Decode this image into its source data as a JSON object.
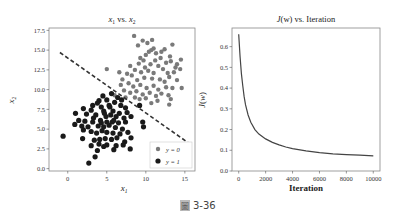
{
  "chart_data": [
    {
      "type": "scatter",
      "title": "x1 vs. x2",
      "title_parts": {
        "a": "x",
        "a_sub": "1",
        "mid": " vs. ",
        "b": "x",
        "b_sub": "2"
      },
      "xlabel": "x1",
      "ylabel": "x2",
      "xlim": [
        -2.4,
        16.3
      ],
      "ylim": [
        -0.3,
        17.8
      ],
      "xticks": [
        0,
        5,
        10,
        15
      ],
      "xtick_labels": [
        "0",
        "5",
        "10",
        "15"
      ],
      "yticks": [
        0.0,
        2.5,
        5.0,
        7.5,
        10.0,
        12.5,
        15.0,
        17.5
      ],
      "ytick_labels": [
        "0.0",
        "2.5",
        "5.0",
        "7.5",
        "10.0",
        "12.5",
        "15.0",
        "17.5"
      ],
      "grid": false,
      "legend": {
        "placement": "bottom-right",
        "entries": [
          {
            "label": "y = 0",
            "color": "#7a7a7a"
          },
          {
            "label": "y = 1",
            "color": "#1a1a1a"
          }
        ]
      },
      "decision_boundary": {
        "style": "dashed",
        "color": "#333333",
        "points": [
          [
            -1.0,
            14.7
          ],
          [
            15.4,
            3.3
          ]
        ]
      },
      "series": [
        {
          "name": "y = 0",
          "color": "#7a7a7a",
          "points": [
            [
              8.5,
              16.8
            ],
            [
              9.6,
              16.2
            ],
            [
              10.2,
              15.9
            ],
            [
              10.8,
              16.3
            ],
            [
              9.0,
              15.6
            ],
            [
              11.0,
              15.2
            ],
            [
              13.4,
              15.7
            ],
            [
              12.0,
              14.8
            ],
            [
              10.4,
              14.8
            ],
            [
              9.3,
              14.0
            ],
            [
              10.0,
              14.4
            ],
            [
              11.3,
              14.6
            ],
            [
              12.6,
              13.4
            ],
            [
              13.2,
              13.6
            ],
            [
              14.0,
              13.2
            ],
            [
              14.5,
              13.8
            ],
            [
              13.8,
              12.8
            ],
            [
              9.1,
              13.3
            ],
            [
              10.6,
              13.2
            ],
            [
              11.6,
              13.0
            ],
            [
              12.2,
              12.6
            ],
            [
              8.6,
              12.5
            ],
            [
              9.4,
              12.2
            ],
            [
              10.3,
              12.4
            ],
            [
              11.0,
              12.1
            ],
            [
              12.8,
              12.1
            ],
            [
              13.6,
              12.2
            ],
            [
              14.4,
              12.6
            ],
            [
              7.6,
              12.0
            ],
            [
              8.2,
              11.8
            ],
            [
              5.0,
              12.6
            ],
            [
              6.6,
              12.2
            ],
            [
              7.0,
              11.3
            ],
            [
              8.9,
              11.2
            ],
            [
              9.8,
              11.5
            ],
            [
              10.8,
              11.4
            ],
            [
              11.8,
              11.3
            ],
            [
              12.4,
              11.0
            ],
            [
              13.0,
              11.6
            ],
            [
              14.0,
              11.2
            ],
            [
              6.8,
              10.6
            ],
            [
              7.8,
              10.8
            ],
            [
              8.4,
              10.4
            ],
            [
              9.3,
              10.6
            ],
            [
              10.1,
              10.2
            ],
            [
              11.0,
              10.5
            ],
            [
              11.6,
              10.0
            ],
            [
              12.6,
              10.3
            ],
            [
              13.4,
              10.2
            ],
            [
              14.6,
              10.2
            ],
            [
              7.2,
              9.9
            ],
            [
              8.0,
              9.6
            ],
            [
              8.8,
              9.8
            ],
            [
              9.6,
              9.4
            ],
            [
              10.5,
              9.6
            ],
            [
              11.3,
              9.2
            ],
            [
              12.0,
              9.5
            ],
            [
              12.9,
              9.3
            ],
            [
              9.2,
              8.8
            ],
            [
              10.0,
              8.9
            ],
            [
              11.5,
              8.6
            ],
            [
              13.2,
              8.8
            ],
            [
              13.0,
              8.1
            ],
            [
              6.0,
              9.3
            ],
            [
              7.4,
              9.0
            ],
            [
              10.7,
              8.3
            ],
            [
              8.6,
              9.0
            ],
            [
              9.9,
              12.8
            ],
            [
              11.9,
              14.0
            ],
            [
              10.7,
              15.0
            ],
            [
              12.4,
              15.1
            ],
            [
              9.7,
              13.7
            ],
            [
              13.1,
              14.2
            ],
            [
              11.2,
              13.7
            ],
            [
              8.0,
              13.0
            ]
          ]
        },
        {
          "name": "y = 1",
          "color": "#1a1a1a",
          "points": [
            [
              4.5,
              9.2
            ],
            [
              5.6,
              9.5
            ],
            [
              6.4,
              9.0
            ],
            [
              4.0,
              8.6
            ],
            [
              5.0,
              8.7
            ],
            [
              6.0,
              8.4
            ],
            [
              3.2,
              8.0
            ],
            [
              4.3,
              7.8
            ],
            [
              5.3,
              8.0
            ],
            [
              6.8,
              8.0
            ],
            [
              7.4,
              7.7
            ],
            [
              9.2,
              8.0
            ],
            [
              2.0,
              7.6
            ],
            [
              3.0,
              7.4
            ],
            [
              4.6,
              7.3
            ],
            [
              5.8,
              7.3
            ],
            [
              6.6,
              7.0
            ],
            [
              7.6,
              7.1
            ],
            [
              1.0,
              7.0
            ],
            [
              2.4,
              6.9
            ],
            [
              3.6,
              6.8
            ],
            [
              4.9,
              6.6
            ],
            [
              5.5,
              6.8
            ],
            [
              6.2,
              6.6
            ],
            [
              7.2,
              6.4
            ],
            [
              8.1,
              6.6
            ],
            [
              1.4,
              6.1
            ],
            [
              2.2,
              6.0
            ],
            [
              3.2,
              5.9
            ],
            [
              4.2,
              6.1
            ],
            [
              5.0,
              5.9
            ],
            [
              5.7,
              5.9
            ],
            [
              6.5,
              5.8
            ],
            [
              7.4,
              5.9
            ],
            [
              9.6,
              5.9
            ],
            [
              0.9,
              5.6
            ],
            [
              1.8,
              5.4
            ],
            [
              2.6,
              5.3
            ],
            [
              3.9,
              5.4
            ],
            [
              4.6,
              5.3
            ],
            [
              5.3,
              5.5
            ],
            [
              6.1,
              5.2
            ],
            [
              7.0,
              5.0
            ],
            [
              9.7,
              5.3
            ],
            [
              2.0,
              4.9
            ],
            [
              3.0,
              4.7
            ],
            [
              3.7,
              4.5
            ],
            [
              4.4,
              4.8
            ],
            [
              5.0,
              4.6
            ],
            [
              5.8,
              4.5
            ],
            [
              6.7,
              4.4
            ],
            [
              7.7,
              4.6
            ],
            [
              -0.6,
              4.1
            ],
            [
              1.9,
              3.8
            ],
            [
              3.4,
              3.6
            ],
            [
              4.1,
              3.7
            ],
            [
              4.8,
              3.8
            ],
            [
              5.6,
              3.7
            ],
            [
              6.3,
              3.9
            ],
            [
              7.3,
              3.4
            ],
            [
              8.1,
              3.9
            ],
            [
              3.0,
              2.9
            ],
            [
              4.0,
              3.1
            ],
            [
              5.0,
              3.0
            ],
            [
              6.2,
              2.9
            ],
            [
              8.0,
              2.5
            ],
            [
              3.8,
              2.3
            ],
            [
              4.6,
              2.8
            ],
            [
              7.1,
              3.0
            ],
            [
              3.5,
              1.5
            ],
            [
              2.7,
              0.7
            ],
            [
              5.9,
              2.4
            ],
            [
              4.3,
              5.8
            ],
            [
              5.4,
              7.8
            ],
            [
              3.8,
              8.3
            ],
            [
              6.9,
              8.7
            ],
            [
              4.7,
              7.0
            ],
            [
              5.9,
              6.1
            ],
            [
              3.3,
              6.4
            ]
          ]
        }
      ]
    },
    {
      "type": "line",
      "title": "J(w) vs. Iteration",
      "title_parts": {
        "a": "J",
        "b": "(w)",
        "rest": " vs. Iteration"
      },
      "xlabel": "Iteration",
      "ylabel": "J(w)",
      "xlim": [
        -500,
        10500
      ],
      "ylim": [
        0.0,
        0.69
      ],
      "xticks": [
        0,
        2000,
        4000,
        6000,
        8000,
        10000
      ],
      "xtick_labels": [
        "0",
        "2000",
        "4000",
        "6000",
        "8000",
        "10000"
      ],
      "yticks": [
        0.0,
        0.1,
        0.2,
        0.3,
        0.4,
        0.5,
        0.6
      ],
      "ytick_labels": [
        "0.0",
        "0.1",
        "0.2",
        "0.3",
        "0.4",
        "0.5",
        "0.6"
      ],
      "grid": false,
      "series": [
        {
          "name": "J(w)",
          "color": "#444444",
          "x": [
            0,
            100,
            200,
            300,
            400,
            500,
            700,
            900,
            1200,
            1500,
            2000,
            2500,
            3000,
            3500,
            4000,
            5000,
            6000,
            7000,
            8000,
            9000,
            10000
          ],
          "y": [
            0.66,
            0.55,
            0.47,
            0.41,
            0.36,
            0.32,
            0.27,
            0.235,
            0.2,
            0.178,
            0.155,
            0.138,
            0.126,
            0.116,
            0.108,
            0.097,
            0.089,
            0.083,
            0.079,
            0.076,
            0.073
          ]
        }
      ]
    }
  ],
  "caption": {
    "glyph": "圖",
    "text": "3-36"
  }
}
